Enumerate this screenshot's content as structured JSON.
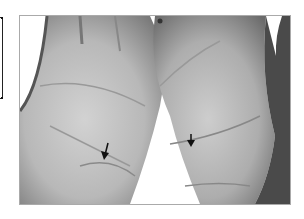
{
  "figure": {
    "palms": [
      {
        "side": "left",
        "arrow_icon": "arrow-down-icon",
        "arrow_position": {
          "x": 105,
          "y": 152
        }
      },
      {
        "side": "right",
        "arrow_icon": "arrow-down-icon",
        "arrow_position": {
          "x": 190,
          "y": 140
        }
      }
    ],
    "colors": {
      "background": "#ffffff",
      "skin_light": "#c8c8c8",
      "skin_mid": "#a8a8a8",
      "skin_dark": "#6e6e6e",
      "frame": "#aaaaaa",
      "arrow": "#111111"
    }
  }
}
